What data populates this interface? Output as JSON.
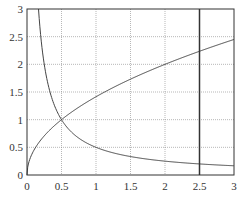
{
  "chart_data": {
    "type": "line",
    "title": "",
    "xlabel": "",
    "ylabel": "",
    "xlim": [
      0,
      3
    ],
    "ylim": [
      0,
      3
    ],
    "grid": true,
    "x_ticks": [
      "0",
      "0.5",
      "1",
      "1.5",
      "2",
      "2.5",
      "3"
    ],
    "y_ticks": [
      "0",
      "0.5",
      "1",
      "1.5",
      "2",
      "2.5",
      "3"
    ],
    "series": [
      {
        "name": "y = 1/(2x)",
        "x": [
          0.167,
          0.2,
          0.25,
          0.3,
          0.4,
          0.5,
          0.75,
          1,
          1.5,
          2,
          2.5,
          3
        ],
        "values": [
          3,
          2.5,
          2,
          1.67,
          1.25,
          1,
          0.67,
          0.5,
          0.33,
          0.25,
          0.2,
          0.17
        ]
      },
      {
        "name": "y = sqrt(2x)",
        "x": [
          0,
          0.05,
          0.1,
          0.25,
          0.5,
          1,
          1.5,
          2,
          2.5,
          3
        ],
        "values": [
          0,
          0.32,
          0.45,
          0.71,
          1,
          1.41,
          1.73,
          2,
          2.24,
          2.45
        ]
      }
    ],
    "annotations": [
      {
        "type": "vertical-line",
        "x": 2.5
      },
      {
        "type": "intersection",
        "x": 0.5,
        "y": 1
      }
    ],
    "colors": {
      "line": "#444444",
      "grid": "#888888",
      "axes": "#333333"
    }
  }
}
